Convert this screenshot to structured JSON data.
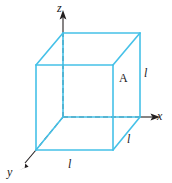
{
  "figure": {
    "type": "3d-cube-with-axes",
    "colors": {
      "cube_edge": "#45c1e8",
      "axis": "#231f20",
      "background": "#ffffff"
    },
    "axes": [
      {
        "name": "z-axis",
        "label": "z",
        "direction": "up"
      },
      {
        "name": "x-axis",
        "label": "x",
        "direction": "right"
      },
      {
        "name": "y-axis",
        "label": "y",
        "direction": "down-left"
      }
    ],
    "labels": {
      "axis_z": "z",
      "axis_x": "x",
      "axis_y": "y",
      "edge_bottom_front": "l",
      "edge_bottom_right": "l",
      "edge_vertical_right": "l",
      "face_area": "A"
    }
  },
  "geometry": {
    "cube": {
      "front_bottom_left": [
        36,
        150
      ],
      "front_bottom_right": [
        113,
        150
      ],
      "front_top_left": [
        36,
        65
      ],
      "front_top_right": [
        113,
        65
      ],
      "back_bottom_left": [
        63,
        117
      ],
      "back_bottom_right": [
        140,
        117
      ],
      "back_top_left": [
        63,
        33
      ],
      "back_top_right": [
        140,
        33
      ]
    },
    "origin": [
      63,
      117
    ]
  }
}
